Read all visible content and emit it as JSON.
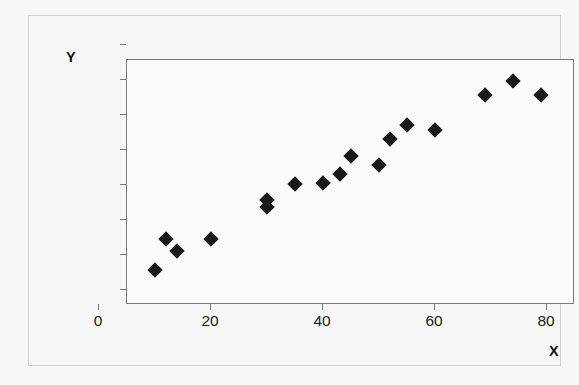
{
  "chart_data": {
    "type": "scatter",
    "title": "",
    "xlabel": "X",
    "ylabel": "Y",
    "xlim": [
      0,
      80
    ],
    "ylim": [
      0,
      140
    ],
    "xticks": [
      0,
      20,
      40,
      60,
      80
    ],
    "yticks": [
      0,
      20,
      40,
      60,
      80,
      100,
      120,
      140
    ],
    "grid": false,
    "legend": null,
    "marker": "diamond",
    "marker_color": "#1a1a1a",
    "series": [
      {
        "name": "data",
        "points": [
          [
            5,
            20
          ],
          [
            7,
            38
          ],
          [
            9,
            31
          ],
          [
            15,
            38
          ],
          [
            25,
            60
          ],
          [
            25,
            56
          ],
          [
            30,
            69
          ],
          [
            35,
            70
          ],
          [
            38,
            75
          ],
          [
            40,
            85
          ],
          [
            45,
            80
          ],
          [
            47,
            95
          ],
          [
            50,
            103
          ],
          [
            55,
            100
          ],
          [
            64,
            120
          ],
          [
            69,
            128
          ],
          [
            74,
            120
          ]
        ]
      }
    ]
  },
  "axes": {
    "y_title": "Y",
    "x_title": "X"
  }
}
